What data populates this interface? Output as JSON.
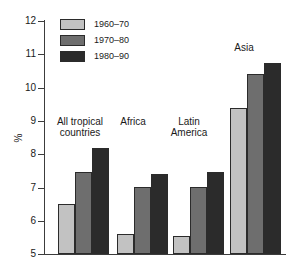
{
  "chart_data": {
    "type": "bar",
    "title": "",
    "xlabel": "",
    "ylabel": "%",
    "ylim": [
      5,
      12
    ],
    "yticks": [
      "5",
      "6",
      "7",
      "8",
      "9",
      "10",
      "11",
      "12"
    ],
    "grid": false,
    "legend_position": "top-left",
    "categories": [
      "All tropical countries",
      "Africa",
      "Latin America",
      "Asia"
    ],
    "series": [
      {
        "name": "1960–70",
        "color": "#c2c2c2",
        "values": [
          6.5,
          5.6,
          5.55,
          9.4
        ]
      },
      {
        "name": "1970–80",
        "color": "#6e6e6e",
        "values": [
          7.45,
          7.0,
          7.0,
          10.4
        ]
      },
      {
        "name": "1980–90",
        "color": "#2b2b2b",
        "values": [
          8.2,
          7.4,
          7.45,
          10.75
        ]
      }
    ],
    "annotations": []
  },
  "legend": {
    "entries": [
      {
        "label": "1960–70"
      },
      {
        "label": "1970–80"
      },
      {
        "label": "1980–90"
      }
    ]
  },
  "axis": {
    "y_label": "%",
    "y_tick_12": "12",
    "y_tick_11": "11",
    "y_tick_10": "10",
    "y_tick_9": "9",
    "y_tick_8": "8",
    "y_tick_7": "7",
    "y_tick_6": "6",
    "y_tick_5": "5"
  },
  "groups": {
    "g0": "All tropical\ncountries",
    "g1": "Africa",
    "g2": "Latin\nAmerica",
    "g3": "Asia"
  }
}
